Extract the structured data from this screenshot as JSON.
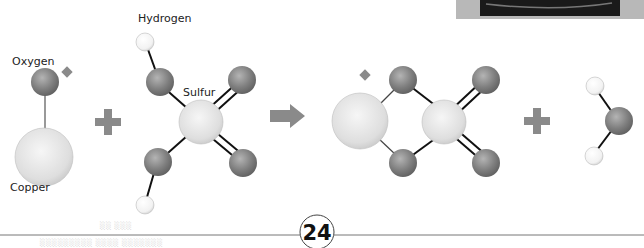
{
  "labels": {
    "oxygen": "Oxygen",
    "copper": "Copper",
    "hydrogen": "Hydrogen",
    "sulfur": "Sulfur"
  },
  "operators": {
    "plus_1": "+",
    "arrow": "yields",
    "plus_2": "+"
  },
  "page_number": "24",
  "footer_ghost_text": {
    "line1": "░░ ░░░",
    "line2": "░░░░░░░░░ ░░░░ ░░░░░░░"
  },
  "colors": {
    "oxygen": "#7a7a7a",
    "copper": "#e4e4e4",
    "sulfur": "#e6e6e6",
    "hydrogen": "#ffffff",
    "operator": "#8a8a8a",
    "bond": "#111111"
  }
}
